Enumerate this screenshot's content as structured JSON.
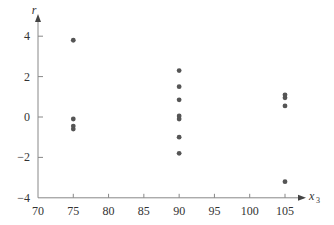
{
  "chart_data": {
    "type": "scatter",
    "title": "",
    "xlabel": "x",
    "xlabel_subscript": "3",
    "ylabel": "r",
    "xlim": [
      70,
      108
    ],
    "ylim": [
      -4,
      4.6
    ],
    "xticks": [
      70,
      75,
      80,
      85,
      90,
      95,
      100,
      105
    ],
    "yticks": [
      -4,
      -2,
      0,
      2,
      4
    ],
    "grid": false,
    "legend": null,
    "series": [
      {
        "name": "residuals",
        "color": "#555555",
        "points": [
          {
            "x": 75,
            "y": 3.8
          },
          {
            "x": 75,
            "y": -0.1
          },
          {
            "x": 75,
            "y": -0.45
          },
          {
            "x": 75,
            "y": -0.6
          },
          {
            "x": 90,
            "y": 2.3
          },
          {
            "x": 90,
            "y": 1.5
          },
          {
            "x": 90,
            "y": 0.85
          },
          {
            "x": 90,
            "y": 0.05
          },
          {
            "x": 90,
            "y": -0.1
          },
          {
            "x": 90,
            "y": -1.0
          },
          {
            "x": 90,
            "y": -1.8
          },
          {
            "x": 105,
            "y": 1.1
          },
          {
            "x": 105,
            "y": 0.95
          },
          {
            "x": 105,
            "y": 0.55
          },
          {
            "x": 105,
            "y": -3.2
          }
        ]
      }
    ]
  },
  "style": {
    "axis_color": "#888888",
    "text_color": "#333333",
    "point_color": "#555555"
  }
}
